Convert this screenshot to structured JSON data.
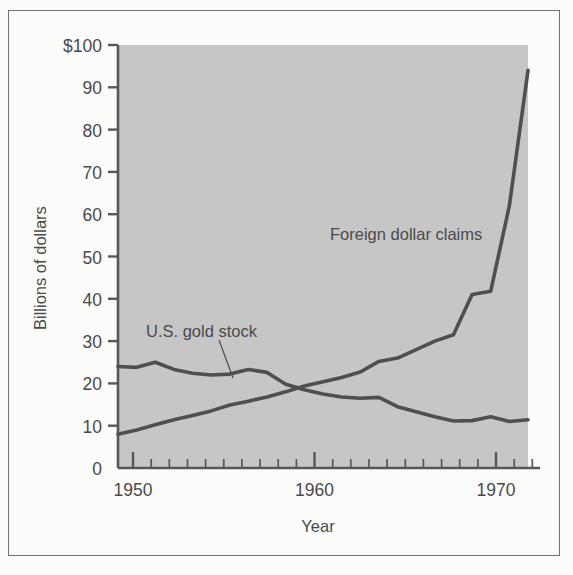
{
  "chart_data": {
    "type": "line",
    "title": "",
    "xlabel": "Year",
    "ylabel": "Billions of dollars",
    "xlim": [
      1950,
      1972
    ],
    "ylim": [
      0,
      100
    ],
    "grid": false,
    "legend_position": "inline-annotations",
    "y_ticks": [
      0,
      10,
      20,
      30,
      40,
      50,
      60,
      70,
      80,
      90,
      100
    ],
    "y_tick_labels": [
      "0",
      "10",
      "20",
      "30",
      "40",
      "50",
      "60",
      "70",
      "80",
      "90",
      "$100"
    ],
    "x_ticks_major": [
      1950,
      1960,
      1970
    ],
    "x_tick_labels": [
      "1950",
      "1960",
      "1970"
    ],
    "x_minor_tick_interval": 1,
    "x": [
      1950,
      1951,
      1952,
      1953,
      1954,
      1955,
      1956,
      1957,
      1958,
      1959,
      1960,
      1961,
      1962,
      1963,
      1964,
      1965,
      1966,
      1967,
      1968,
      1969,
      1970,
      1971,
      1972
    ],
    "series": [
      {
        "name": "U.S. gold stock",
        "label": "U.S. gold stock",
        "color": "#4d4f51",
        "values": [
          24.0,
          23.8,
          25.0,
          23.3,
          22.4,
          22.0,
          22.2,
          23.3,
          22.6,
          19.8,
          18.5,
          17.5,
          16.8,
          16.5,
          16.7,
          14.5,
          13.3,
          12.1,
          11.1,
          11.2,
          12.1,
          11.0,
          11.4
        ]
      },
      {
        "name": "Foreign dollar claims",
        "label": "Foreign dollar claims",
        "color": "#4d4f51",
        "values": [
          8.0,
          9.0,
          10.2,
          11.4,
          12.4,
          13.5,
          14.9,
          15.8,
          16.8,
          18.0,
          19.4,
          20.4,
          21.4,
          22.7,
          25.2,
          26.0,
          28.0,
          30.0,
          31.5,
          41.0,
          41.8,
          62.0,
          94.0
        ]
      }
    ],
    "annotations": [
      {
        "text": "U.S. gold stock",
        "x": 1952.6,
        "y": 32.5
      },
      {
        "text": "Foreign dollar claims",
        "x": 1961.5,
        "y": 54.0
      }
    ]
  }
}
